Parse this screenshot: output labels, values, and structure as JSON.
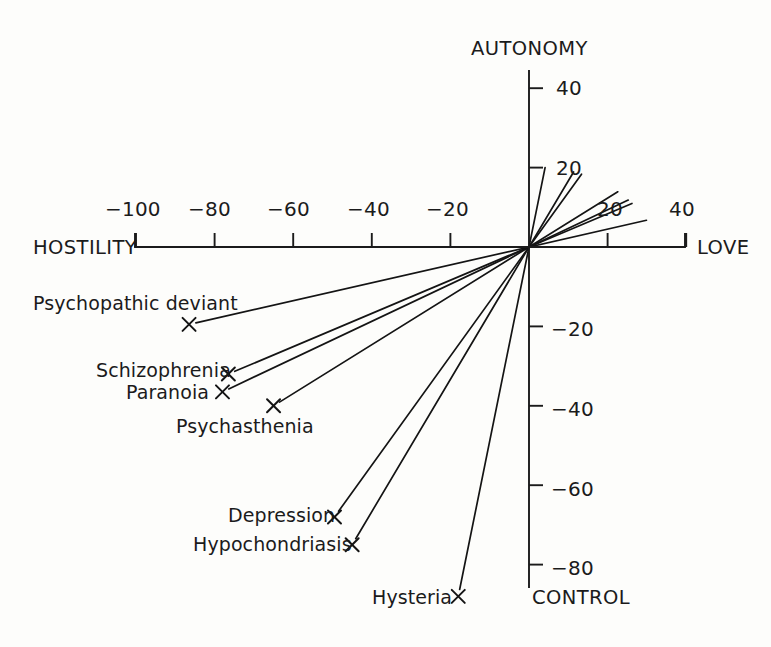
{
  "chart_data": {
    "type": "scatter",
    "title": "",
    "subtitle": "",
    "xlabel": "HOSTILITY – LOVE",
    "ylabel": "AUTONOMY – CONTROL",
    "xlim": [
      -100,
      40
    ],
    "ylim": [
      -88,
      44
    ],
    "grid": false,
    "legend": "none",
    "axis_endpoint_labels": {
      "x_left": "HOSTILITY",
      "x_right": "LOVE",
      "y_top": "AUTONOMY",
      "y_bottom": "CONTROL"
    },
    "x_ticks": [
      {
        "value": -100,
        "label": "−100"
      },
      {
        "value": -80,
        "label": "−80"
      },
      {
        "value": -60,
        "label": "−60"
      },
      {
        "value": -40,
        "label": "−40"
      },
      {
        "value": -20,
        "label": "−20"
      },
      {
        "value": 20,
        "label": "20"
      },
      {
        "value": 40,
        "label": "40"
      }
    ],
    "y_ticks": [
      {
        "value": 40,
        "label": "40"
      },
      {
        "value": 20,
        "label": "20"
      },
      {
        "value": -20,
        "label": "−20"
      },
      {
        "value": -40,
        "label": "−40"
      },
      {
        "value": -60,
        "label": "−60"
      },
      {
        "value": -80,
        "label": "−80"
      }
    ],
    "marker_symbol": "×",
    "note": "Each scale is drawn as a straight line through the origin; the cross marks the scale vector endpoint and the opposite ray extends into the upper-right quadrant.",
    "points": [
      {
        "name": "Psychopathic deviant",
        "x": -86.5,
        "y": -19.5,
        "label_anchor": "end"
      },
      {
        "name": "Schizophrenia",
        "x": -76.5,
        "y": -32.0,
        "label_anchor": "end"
      },
      {
        "name": "Paranoia",
        "x": -78.0,
        "y": -36.5,
        "label_anchor": "end"
      },
      {
        "name": "Psychasthenia",
        "x": -65.0,
        "y": -40.0,
        "label_anchor": "below"
      },
      {
        "name": "Depression",
        "x": -49.5,
        "y": -68.0,
        "label_anchor": "end"
      },
      {
        "name": "Hypochondriasis",
        "x": -45.0,
        "y": -75.0,
        "label_anchor": "end"
      },
      {
        "name": "Hysteria",
        "x": -18.0,
        "y": -88.0,
        "label_anchor": "end"
      }
    ]
  },
  "labels": {
    "hostility": "HOSTILITY",
    "love": "LOVE",
    "autonomy": "AUTONOMY",
    "control": "CONTROL",
    "x_neg100": "−100",
    "x_neg80": "−80",
    "x_neg60": "−60",
    "x_neg40": "−40",
    "x_neg20": "−20",
    "x_pos20": "20",
    "x_pos40": "40",
    "y_pos40": "40",
    "y_pos20": "20",
    "y_neg20": "−20",
    "y_neg40": "−40",
    "y_neg60": "−60",
    "y_neg80": "−80",
    "p_psychopathic_deviant": "Psychopathic deviant",
    "p_schizophrenia": "Schizophrenia",
    "p_paranoia": "Paranoia",
    "p_psychasthenia": "Psychasthenia",
    "p_depression": "Depression",
    "p_hypochondriasis": "Hypochondriasis",
    "p_hysteria": "Hysteria"
  },
  "colors": {
    "ink": "#1b1b1b",
    "background": "#fdfdfb"
  }
}
